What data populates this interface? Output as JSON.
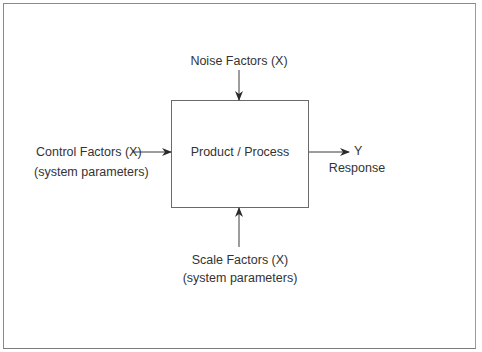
{
  "diagram": {
    "type": "block-diagram",
    "process_box": {
      "label": "Product / Process"
    },
    "inputs": {
      "noise": {
        "line1": "Noise Factors (X)"
      },
      "control": {
        "line1": "Control Factors (X)",
        "line2": "(system parameters)"
      },
      "scale": {
        "line1": "Scale Factors (X)",
        "line2": "(system parameters)"
      }
    },
    "output": {
      "line1": "Y",
      "line2": "Response"
    },
    "colors": {
      "line": "#3a3a3a",
      "text": "#333333",
      "frame": "#8a8a8a"
    }
  }
}
